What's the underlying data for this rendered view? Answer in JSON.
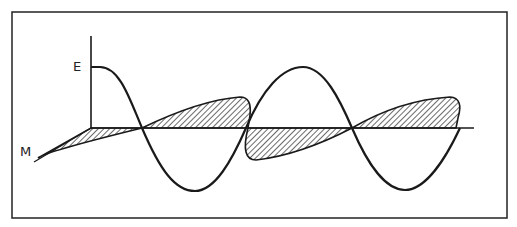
{
  "diagram": {
    "labels": {
      "electric": "E",
      "magnetic": "M"
    },
    "colors": {
      "stroke": "#1a1a1a",
      "frame": "#222222",
      "background": "#ffffff"
    }
  }
}
